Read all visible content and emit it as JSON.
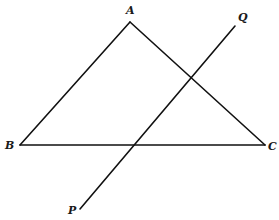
{
  "diagram": {
    "type": "geometry",
    "points": {
      "A": {
        "label": "A",
        "x": 130,
        "y": 22,
        "label_x": 126,
        "label_y": 14
      },
      "B": {
        "label": "B",
        "x": 20,
        "y": 145,
        "label_x": 5,
        "label_y": 149
      },
      "C": {
        "label": "C",
        "x": 265,
        "y": 145,
        "label_x": 268,
        "label_y": 150
      },
      "P": {
        "label": "P",
        "x": 80,
        "y": 209,
        "label_x": 68,
        "label_y": 214
      },
      "Q": {
        "label": "Q",
        "x": 235,
        "y": 26,
        "label_x": 238,
        "label_y": 21
      }
    },
    "segments": [
      {
        "id": "AB",
        "from": "A",
        "to": "B"
      },
      {
        "id": "AC",
        "from": "A",
        "to": "C"
      },
      {
        "id": "BC",
        "from": "B",
        "to": "C"
      },
      {
        "id": "PQ",
        "from": "P",
        "to": "Q"
      }
    ],
    "colors": {
      "line": "#111111",
      "background": "#ffffff"
    }
  }
}
